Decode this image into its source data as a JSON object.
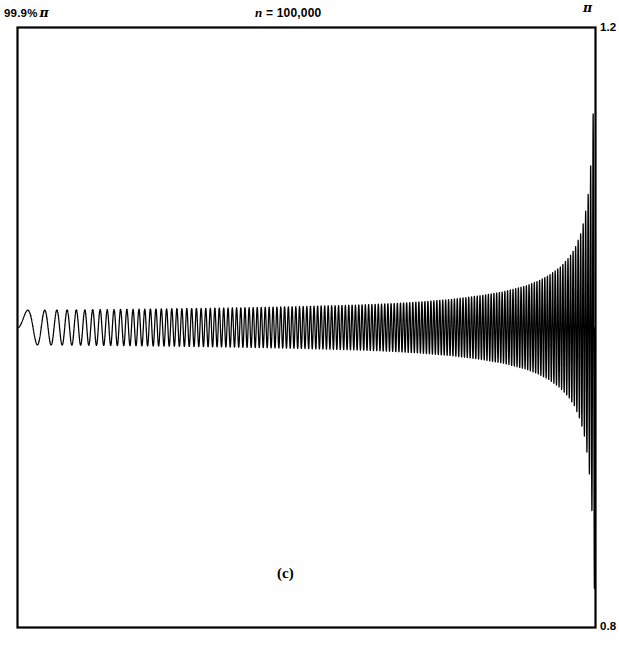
{
  "figure": {
    "panel_label": "(c)",
    "title_prefix": "n",
    "title_rest": " = 100,000",
    "x_left_label": "99.9%",
    "x_left_symbol": "π",
    "x_right_symbol": "π",
    "y_top_label": "1.2",
    "y_bottom_label": "0.8",
    "line_color": "#000000",
    "frame_color": "#000000",
    "background_color": "#ffffff"
  },
  "chart_data": {
    "type": "line",
    "title": "n = 100,000",
    "subtitle": "(c)",
    "xlabel": "",
    "ylabel": "",
    "xlim": [
      0.999,
      1.0
    ],
    "xlim_labels": [
      "99.9% π",
      "π"
    ],
    "ylim": [
      0.8,
      1.2
    ],
    "ytick_labels": [
      "0.8",
      "1.2"
    ],
    "grid": false,
    "legend": null,
    "n_terms": 100000,
    "series": [
      {
        "name": "partial sum S_n(x)",
        "baseline": 1.0,
        "envelope_model": "amplitude grows toward x = pi",
        "x_fraction": [
          0.0,
          0.1,
          0.2,
          0.3,
          0.4,
          0.5,
          0.6,
          0.65,
          0.7,
          0.75,
          0.8,
          0.84,
          0.88,
          0.9,
          0.92,
          0.94,
          0.955,
          0.965,
          0.975,
          0.982,
          0.988,
          0.992,
          0.995,
          0.997,
          0.9985,
          1.0
        ],
        "amplitude": [
          0.0115,
          0.0118,
          0.0122,
          0.0127,
          0.0133,
          0.0141,
          0.0152,
          0.016,
          0.0172,
          0.0188,
          0.0212,
          0.0238,
          0.0278,
          0.0308,
          0.0348,
          0.0405,
          0.0468,
          0.0528,
          0.0625,
          0.0732,
          0.0885,
          0.105,
          0.125,
          0.145,
          0.168,
          0.19
        ],
        "oscillation_cycles": 150
      }
    ]
  }
}
